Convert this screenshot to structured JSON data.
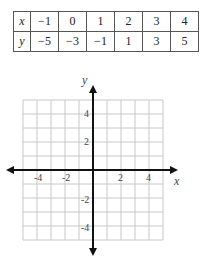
{
  "table": {
    "rows": [
      {
        "label": "x",
        "values": [
          "−1",
          "0",
          "1",
          "2",
          "3",
          "4"
        ]
      },
      {
        "label": "y",
        "values": [
          "−5",
          "−3",
          "−1",
          "1",
          "3",
          "5"
        ]
      }
    ]
  },
  "graph": {
    "x_label": "x",
    "y_label": "y",
    "x_ticks": [
      "-4",
      "-2",
      "2",
      "4"
    ],
    "y_ticks": [
      "4",
      "2",
      "-2",
      "-4"
    ]
  },
  "chart_data": {
    "type": "table",
    "title": "",
    "columns": [
      "x",
      "y"
    ],
    "x": [
      -1,
      0,
      1,
      2,
      3,
      4
    ],
    "y": [
      -5,
      -3,
      -1,
      1,
      3,
      5
    ],
    "grid": {
      "xlim": [
        -5,
        5
      ],
      "ylim": [
        -5,
        5
      ],
      "x_ticks": [
        -4,
        -2,
        2,
        4
      ],
      "y_ticks": [
        -4,
        -2,
        2,
        4
      ],
      "xlabel": "x",
      "ylabel": "y",
      "grid_on": true,
      "plotted_points": []
    }
  }
}
